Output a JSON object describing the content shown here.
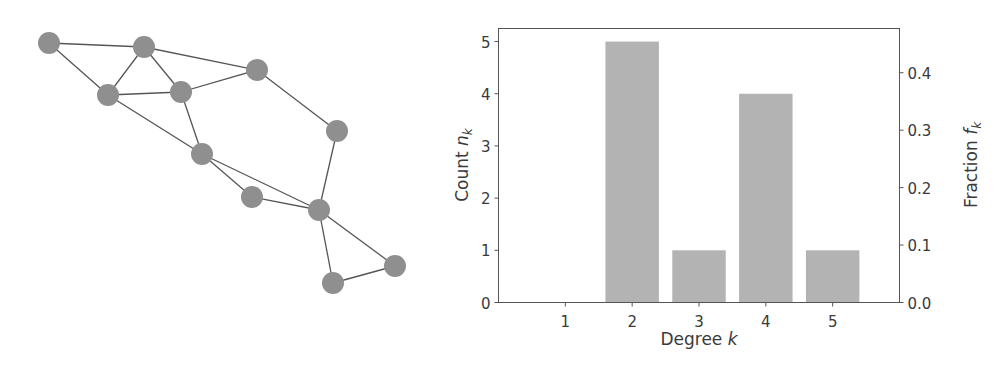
{
  "figure": {
    "network": {
      "node_color": "#8f8f8f",
      "edge_color": "#555555",
      "node_radius": 11,
      "nodes": [
        {
          "id": "A",
          "x": 49,
          "y": 43,
          "degree": 2
        },
        {
          "id": "B",
          "x": 144,
          "y": 47,
          "degree": 4
        },
        {
          "id": "C",
          "x": 257,
          "y": 70,
          "degree": 3
        },
        {
          "id": "D",
          "x": 108,
          "y": 95,
          "degree": 4
        },
        {
          "id": "E",
          "x": 181,
          "y": 92,
          "degree": 4
        },
        {
          "id": "F",
          "x": 337,
          "y": 131,
          "degree": 2
        },
        {
          "id": "G",
          "x": 202,
          "y": 154,
          "degree": 4
        },
        {
          "id": "H",
          "x": 252,
          "y": 197,
          "degree": 2
        },
        {
          "id": "I",
          "x": 319,
          "y": 210,
          "degree": 5
        },
        {
          "id": "J",
          "x": 333,
          "y": 283,
          "degree": 2
        },
        {
          "id": "K",
          "x": 395,
          "y": 266,
          "degree": 2
        }
      ],
      "edges": [
        [
          "A",
          "B"
        ],
        [
          "A",
          "D"
        ],
        [
          "B",
          "D"
        ],
        [
          "B",
          "E"
        ],
        [
          "B",
          "C"
        ],
        [
          "D",
          "E"
        ],
        [
          "E",
          "C"
        ],
        [
          "C",
          "F"
        ],
        [
          "D",
          "G"
        ],
        [
          "E",
          "G"
        ],
        [
          "G",
          "H"
        ],
        [
          "G",
          "I"
        ],
        [
          "H",
          "I"
        ],
        [
          "F",
          "I"
        ],
        [
          "I",
          "J"
        ],
        [
          "I",
          "K"
        ],
        [
          "J",
          "K"
        ]
      ]
    }
  },
  "chart_data": {
    "type": "bar",
    "title": "",
    "categories": [
      1,
      2,
      3,
      4,
      5
    ],
    "values": [
      0,
      5,
      1,
      4,
      1
    ],
    "secondary_values": [
      0.0,
      0.4545,
      0.0909,
      0.3636,
      0.0909
    ],
    "xlabel": "Degree k",
    "ylabel": "Count n_k",
    "ylabel_right": "Fraction f_k",
    "xlim": [
      0,
      6
    ],
    "ylim": [
      0,
      5.25
    ],
    "ylim_right": [
      0,
      0.477
    ],
    "xticks": [
      "1",
      "2",
      "3",
      "4",
      "5"
    ],
    "yticks": [
      "0",
      "1",
      "2",
      "3",
      "4",
      "5"
    ],
    "yticks_right": [
      "0.0",
      "0.1",
      "0.2",
      "0.3",
      "0.4"
    ],
    "bar_color": "#b3b3b3",
    "grid": false,
    "legend": null
  },
  "labels": {
    "xlabel_main": "Degree ",
    "xlabel_var": "k",
    "ylabel_main": "Count ",
    "ylabel_var": "n",
    "ylabel_sub": "k",
    "ylabel_right_main": "Fraction ",
    "ylabel_right_var": "f",
    "ylabel_right_sub": "k"
  }
}
